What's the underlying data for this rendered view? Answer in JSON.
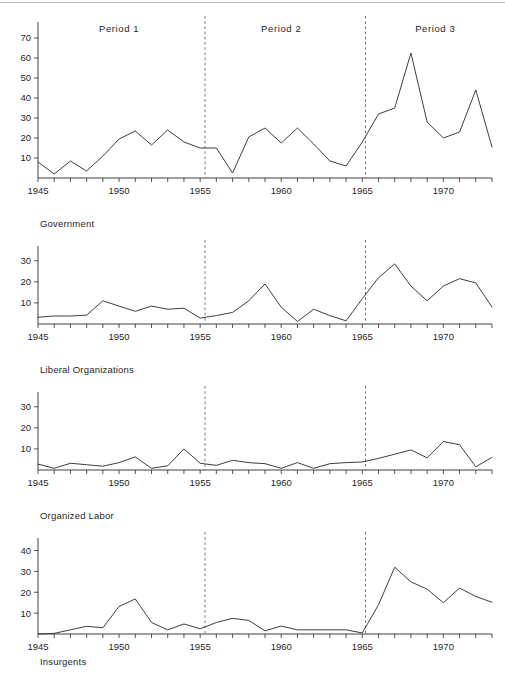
{
  "figure": {
    "panels": [
      {
        "caption": "Government",
        "period_labels": [
          "Period  1",
          "Period  2",
          "Period  3"
        ],
        "y_ticks": [
          10,
          20,
          30,
          40,
          50,
          60,
          70
        ],
        "y_max": 78,
        "x_ticks_labeled": [
          1945,
          1950,
          1955,
          1960,
          1965,
          1970
        ]
      },
      {
        "caption": "Liberal Organizations",
        "y_ticks": [
          10,
          20,
          30
        ],
        "y_max": 37,
        "x_ticks_labeled": [
          1945,
          1950,
          1955,
          1960,
          1965,
          1970
        ]
      },
      {
        "caption": "Organized Labor",
        "y_ticks": [
          10,
          20,
          30
        ],
        "y_max": 37,
        "x_ticks_labeled": [
          1945,
          1950,
          1955,
          1960,
          1965,
          1970
        ]
      },
      {
        "caption": "Insurgents",
        "y_ticks": [
          10,
          20,
          30,
          40
        ],
        "y_max": 46,
        "x_ticks_labeled": [
          1945,
          1950,
          1955,
          1960,
          1965,
          1970
        ]
      }
    ]
  },
  "chart_data": [
    {
      "type": "line",
      "title": "",
      "panel_label": "Government",
      "xlabel": "",
      "ylabel": "",
      "xlim": [
        1945,
        1973
      ],
      "ylim": [
        0,
        78
      ],
      "grid": false,
      "legend": "none",
      "annotations": [
        {
          "text": "Period  1",
          "x": 1950,
          "y": 73
        },
        {
          "text": "Period  2",
          "x": 1960,
          "y": 73
        },
        {
          "text": "Period  3",
          "x": 1969.5,
          "y": 73
        },
        {
          "text": "divider",
          "x": 1955.3,
          "y": null
        },
        {
          "text": "divider",
          "x": 1965.2,
          "y": null
        }
      ],
      "x": [
        1945,
        1946,
        1947,
        1948,
        1949,
        1950,
        1951,
        1952,
        1953,
        1954,
        1955,
        1956,
        1957,
        1958,
        1959,
        1960,
        1961,
        1962,
        1963,
        1964,
        1965,
        1966,
        1967,
        1968,
        1969,
        1970,
        1971,
        1972,
        1973
      ],
      "values": [
        8,
        2,
        8.5,
        3.5,
        11,
        19.5,
        23.5,
        16.5,
        24,
        18,
        15,
        15,
        2.5,
        20.5,
        25,
        17.5,
        25,
        17,
        8.5,
        6,
        18,
        32,
        35,
        62.5,
        28,
        20,
        23,
        44,
        15.5
      ]
    },
    {
      "type": "line",
      "title": "",
      "panel_label": "Liberal Organizations",
      "xlabel": "",
      "ylabel": "",
      "xlim": [
        1945,
        1973
      ],
      "ylim": [
        0,
        37
      ],
      "grid": false,
      "legend": "none",
      "annotations": [
        {
          "text": "divider",
          "x": 1955.3,
          "y": null
        },
        {
          "text": "divider",
          "x": 1965.2,
          "y": null
        }
      ],
      "x": [
        1945,
        1946,
        1947,
        1948,
        1949,
        1950,
        1951,
        1952,
        1953,
        1954,
        1955,
        1956,
        1957,
        1958,
        1959,
        1960,
        1961,
        1962,
        1963,
        1964,
        1965,
        1966,
        1967,
        1968,
        1969,
        1970,
        1971,
        1972,
        1973
      ],
      "values": [
        3.2,
        3.8,
        3.8,
        4.2,
        11,
        8.5,
        6,
        8.5,
        7,
        7.5,
        2.8,
        4,
        5.5,
        11,
        19,
        8,
        1.2,
        7,
        4,
        1.5,
        12,
        22,
        28.5,
        18,
        11,
        18,
        21.5,
        19.5,
        8
      ]
    },
    {
      "type": "line",
      "title": "",
      "panel_label": "Organized Labor",
      "xlabel": "",
      "ylabel": "",
      "xlim": [
        1945,
        1973
      ],
      "ylim": [
        0,
        37
      ],
      "grid": false,
      "legend": "none",
      "annotations": [
        {
          "text": "divider",
          "x": 1955.3,
          "y": null
        },
        {
          "text": "divider",
          "x": 1965.2,
          "y": null
        }
      ],
      "x": [
        1945,
        1946,
        1947,
        1948,
        1949,
        1950,
        1951,
        1952,
        1953,
        1954,
        1955,
        1956,
        1957,
        1958,
        1959,
        1960,
        1961,
        1962,
        1963,
        1964,
        1965,
        1966,
        1967,
        1968,
        1969,
        1970,
        1971,
        1972,
        1973
      ],
      "values": [
        2.8,
        0.8,
        3.2,
        2.5,
        1.8,
        3.5,
        6.2,
        0.8,
        2,
        10,
        3.2,
        2.2,
        4.6,
        3.5,
        3,
        0.8,
        3.5,
        0.8,
        3,
        3.5,
        3.8,
        5.5,
        7.5,
        9.5,
        5.8,
        13.5,
        12,
        1.5,
        6
      ]
    },
    {
      "type": "line",
      "title": "",
      "panel_label": "Insurgents",
      "xlabel": "",
      "ylabel": "",
      "xlim": [
        1945,
        1973
      ],
      "ylim": [
        0,
        46
      ],
      "grid": false,
      "legend": "none",
      "annotations": [
        {
          "text": "divider",
          "x": 1955.3,
          "y": null
        },
        {
          "text": "divider",
          "x": 1965.2,
          "y": null
        }
      ],
      "x": [
        1945,
        1946,
        1947,
        1948,
        1949,
        1950,
        1951,
        1952,
        1953,
        1954,
        1955,
        1956,
        1957,
        1958,
        1959,
        1960,
        1961,
        1962,
        1963,
        1964,
        1965,
        1966,
        1967,
        1968,
        1969,
        1970,
        1971,
        1972,
        1973
      ],
      "values": [
        0,
        0.3,
        2,
        3.7,
        3,
        13.2,
        16.8,
        5.5,
        2,
        4.8,
        2.5,
        5.5,
        7.5,
        6.5,
        1.5,
        3.8,
        2,
        2,
        2,
        2,
        0.5,
        14,
        32,
        25,
        21.5,
        15,
        22,
        18,
        15.2
      ]
    }
  ],
  "colors": {
    "line": "#333333",
    "axis": "#2b2b2b",
    "divider": "#666666",
    "text": "#1f1f1f",
    "background": "#ffffff"
  }
}
